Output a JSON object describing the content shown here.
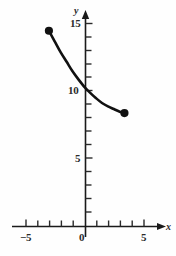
{
  "figure": {
    "width": 176,
    "height": 256,
    "background_color": "#fefefe",
    "ink_color": "#111111"
  },
  "chart_data": {
    "type": "line",
    "title": "",
    "xlabel": "x",
    "ylabel": "y",
    "xlim": [
      -6.0,
      6.5
    ],
    "ylim": [
      0,
      16.5
    ],
    "grid": false,
    "legend": null,
    "x_ticks_major": [
      -5,
      0,
      5
    ],
    "x_tick_labels": [
      "−5",
      "0",
      "5"
    ],
    "x_ticks_minor": [
      -4,
      -3,
      -2,
      -1,
      1,
      2,
      3,
      4
    ],
    "y_ticks_major": [
      5,
      10,
      15
    ],
    "y_tick_labels": [
      "5",
      "10",
      "15"
    ],
    "y_ticks_minor": [
      1,
      2,
      3,
      4,
      6,
      7,
      8,
      9,
      11,
      12,
      13,
      14
    ],
    "y_intercept": 10.3,
    "series": [
      {
        "name": "decaying exponential",
        "style": "solid-thick",
        "endpoints_filled": true,
        "x": [
          -3.1,
          -2.6,
          -2.1,
          -1.6,
          -1.1,
          -0.6,
          -0.1,
          0.4,
          0.9,
          1.4,
          1.9,
          2.4,
          2.9,
          3.3
        ],
        "y": [
          14.5,
          13.7,
          12.9,
          12.2,
          11.5,
          10.9,
          10.35,
          9.9,
          9.5,
          9.15,
          8.9,
          8.7,
          8.5,
          8.4
        ]
      }
    ],
    "markers": [
      {
        "label": "left-endpoint",
        "x": -3.1,
        "y": 14.5,
        "filled": true
      },
      {
        "label": "right-endpoint",
        "x": 3.3,
        "y": 8.4,
        "filled": true
      }
    ]
  },
  "labels": {
    "y_axis_name": "y",
    "x_axis_name": "x",
    "y_15": "15",
    "y_10": "10",
    "y_5": "5",
    "x_neg5": "−5",
    "x_0": "0",
    "x_5": "5"
  }
}
